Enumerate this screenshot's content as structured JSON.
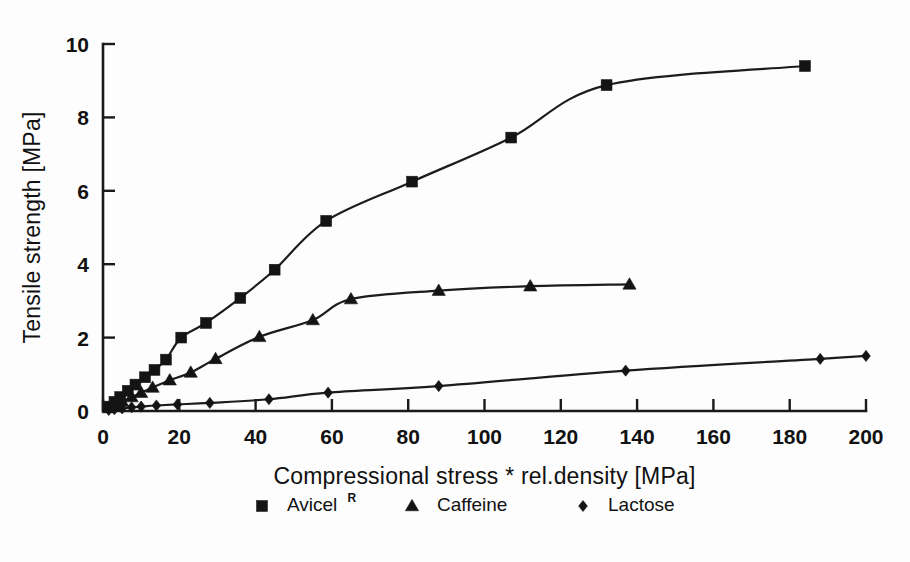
{
  "chart_data": {
    "type": "scatter",
    "title": "",
    "xlabel": "Compressional stress * rel.density [MPa]",
    "ylabel": "Tensile strength [MPa]",
    "xlim": [
      0,
      200
    ],
    "ylim": [
      0,
      10
    ],
    "xticks": [
      0,
      20,
      40,
      60,
      80,
      100,
      120,
      140,
      160,
      180,
      200
    ],
    "yticks": [
      0,
      2,
      4,
      6,
      8,
      10
    ],
    "xtick_labels": [
      "0",
      "20",
      "40",
      "60",
      "80",
      "100",
      "120",
      "140",
      "160",
      "180",
      "200"
    ],
    "ytick_labels": [
      "0",
      "2",
      "4",
      "6",
      "8",
      "10"
    ],
    "grid": false,
    "legend_position": "bottom-center",
    "series": [
      {
        "name": "Avicel",
        "name_superscript": "R",
        "marker": "square",
        "points": [
          {
            "x": 1.5,
            "y": 0.12
          },
          {
            "x": 3.0,
            "y": 0.25
          },
          {
            "x": 4.5,
            "y": 0.38
          },
          {
            "x": 6.5,
            "y": 0.55
          },
          {
            "x": 8.5,
            "y": 0.72
          },
          {
            "x": 11.0,
            "y": 0.92
          },
          {
            "x": 13.5,
            "y": 1.12
          },
          {
            "x": 16.5,
            "y": 1.4
          },
          {
            "x": 20.5,
            "y": 2.0
          },
          {
            "x": 27.0,
            "y": 2.4
          },
          {
            "x": 36.0,
            "y": 3.08
          },
          {
            "x": 45.0,
            "y": 3.85
          },
          {
            "x": 58.5,
            "y": 5.18
          },
          {
            "x": 81.0,
            "y": 6.25
          },
          {
            "x": 107.0,
            "y": 7.45
          },
          {
            "x": 132.0,
            "y": 8.88
          },
          {
            "x": 184.0,
            "y": 9.4
          }
        ]
      },
      {
        "name": "Caffeine",
        "name_superscript": "",
        "marker": "triangle",
        "points": [
          {
            "x": 1.5,
            "y": 0.08
          },
          {
            "x": 3.0,
            "y": 0.16
          },
          {
            "x": 5.0,
            "y": 0.26
          },
          {
            "x": 7.5,
            "y": 0.38
          },
          {
            "x": 10.0,
            "y": 0.5
          },
          {
            "x": 13.0,
            "y": 0.64
          },
          {
            "x": 17.5,
            "y": 0.84
          },
          {
            "x": 23.0,
            "y": 1.05
          },
          {
            "x": 29.5,
            "y": 1.42
          },
          {
            "x": 41.0,
            "y": 2.02
          },
          {
            "x": 55.0,
            "y": 2.48
          },
          {
            "x": 65.0,
            "y": 3.05
          },
          {
            "x": 88.0,
            "y": 3.28
          },
          {
            "x": 112.0,
            "y": 3.4
          },
          {
            "x": 138.0,
            "y": 3.45
          }
        ]
      },
      {
        "name": "Lactose",
        "name_superscript": "",
        "marker": "diamond",
        "points": [
          {
            "x": 1.5,
            "y": 0.03
          },
          {
            "x": 3.0,
            "y": 0.05
          },
          {
            "x": 5.0,
            "y": 0.07
          },
          {
            "x": 7.5,
            "y": 0.1
          },
          {
            "x": 10.0,
            "y": 0.12
          },
          {
            "x": 14.0,
            "y": 0.15
          },
          {
            "x": 19.5,
            "y": 0.18
          },
          {
            "x": 28.0,
            "y": 0.22
          },
          {
            "x": 43.5,
            "y": 0.32
          },
          {
            "x": 59.0,
            "y": 0.5
          },
          {
            "x": 88.0,
            "y": 0.68
          },
          {
            "x": 137.0,
            "y": 1.1
          },
          {
            "x": 188.0,
            "y": 1.42
          },
          {
            "x": 200.0,
            "y": 1.5
          }
        ]
      }
    ]
  },
  "legend": {
    "items": [
      {
        "label": "Avicel",
        "superscript": "R",
        "marker": "square-marker-icon"
      },
      {
        "label": "Caffeine",
        "superscript": "",
        "marker": "triangle-marker-icon"
      },
      {
        "label": "Lactose",
        "superscript": "",
        "marker": "diamond-marker-icon"
      }
    ]
  },
  "colors": {
    "ink": "#141414",
    "background": "#fdfdfd"
  }
}
